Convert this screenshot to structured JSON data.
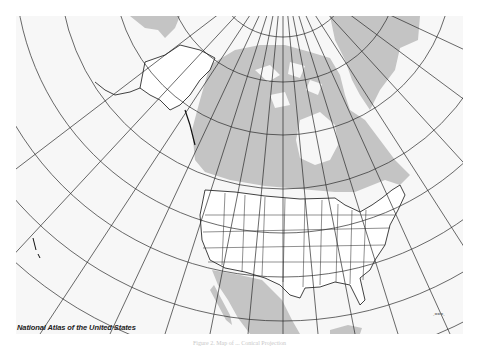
{
  "map": {
    "credit": "National Atlas of the United States",
    "caption": "Figure 2. Map of ... Conical Projection",
    "scale_mark": ".===.",
    "colors": {
      "background": "#f7f7f7",
      "land_gray": "#c4c4c4",
      "us_land": "#ffffff",
      "graticule": "#2a2a2a",
      "border": "#111111"
    },
    "projection": "conic (pole near top-center)",
    "regions": [
      "Alaska",
      "Canada",
      "Greenland",
      "Conterminous United States",
      "Mexico",
      "Hawaii",
      "Cuba"
    ]
  }
}
